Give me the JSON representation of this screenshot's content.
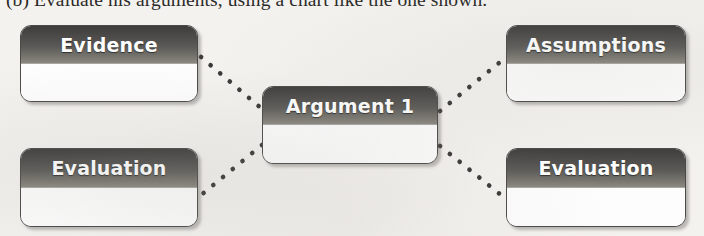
{
  "caption": {
    "text": "(b) Evaluate his arguments, using a chart like the one shown."
  },
  "chart": {
    "type": "concept-map",
    "center_node": {
      "id": "argument",
      "title": "Argument 1"
    },
    "nodes": [
      {
        "id": "evidence",
        "title": "Evidence",
        "position": "top-left"
      },
      {
        "id": "assumptions",
        "title": "Assumptions",
        "position": "top-right"
      },
      {
        "id": "argument",
        "title": "Argument 1",
        "position": "center"
      },
      {
        "id": "evaluation-left",
        "title": "Evaluation",
        "position": "bottom-left"
      },
      {
        "id": "evaluation-right",
        "title": "Evaluation",
        "position": "bottom-right"
      }
    ],
    "connectors": [
      {
        "from": "evidence",
        "to": "argument",
        "style": "dotted"
      },
      {
        "from": "argument",
        "to": "assumptions",
        "style": "dotted"
      },
      {
        "from": "argument",
        "to": "evaluation-left",
        "style": "dotted"
      },
      {
        "from": "argument",
        "to": "evaluation-right",
        "style": "dotted"
      }
    ],
    "colors": {
      "header_dark": "#3f3d3b",
      "header_light": "#8d8b84",
      "body": "#ffffff",
      "border": "#4c4a47",
      "connector": "#3a3836",
      "page_background": "#f4f2ef",
      "title_text": "#ffffff"
    }
  }
}
